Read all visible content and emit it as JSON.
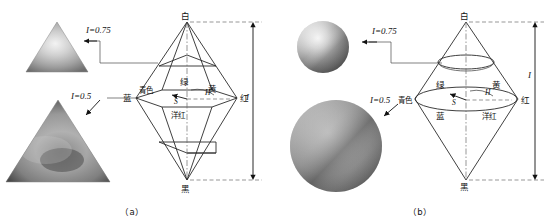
{
  "figure": {
    "panels": [
      {
        "id": "a",
        "caption": "（a）",
        "solid_shape": "double-triangular-cone",
        "cross_section_shape": "triangle",
        "vertex_labels": {
          "top": "白",
          "bottom": "黑",
          "left": "蓝",
          "right": "红"
        },
        "hue_labels": {
          "green": "绿",
          "cyan": "青色",
          "yellow": "黄",
          "blue": "蓝",
          "red": "红",
          "magenta": "洋红"
        },
        "annotations": {
          "hue_symbol": "H",
          "saturation_symbol": "S",
          "intensity_symbol": "I",
          "dimension_label": "I"
        },
        "callouts": [
          {
            "label": "I=0.75",
            "target": "upper cross-section triangle"
          },
          {
            "label": "I=0.5",
            "target": "mid cross-section triangle"
          }
        ],
        "swatches": [
          {
            "name": "intensity-0.75-triangle",
            "intensity": 0.75
          },
          {
            "name": "intensity-0.5-triangle",
            "intensity": 0.5
          }
        ]
      },
      {
        "id": "b",
        "caption": "（b）",
        "solid_shape": "double-circular-cone",
        "cross_section_shape": "circle",
        "vertex_labels": {
          "top": "白",
          "bottom": "黑",
          "right": "红"
        },
        "hue_labels": {
          "green": "绿",
          "cyan": "青色",
          "yellow": "黄",
          "blue": "蓝",
          "red": "红",
          "magenta": "洋红"
        },
        "annotations": {
          "hue_symbol": "H",
          "saturation_symbol": "S",
          "intensity_symbol": "I",
          "dimension_label": "I"
        },
        "callouts": [
          {
            "label": "I=0.75",
            "target": "upper cross-section circle"
          },
          {
            "label": "I=0.5",
            "target": "mid cross-section circle"
          }
        ],
        "swatches": [
          {
            "name": "intensity-0.75-sphere",
            "intensity": 0.75
          },
          {
            "name": "intensity-0.5-sphere",
            "intensity": 0.5
          }
        ]
      }
    ],
    "colors": {
      "line": "#2a2a2a",
      "dashed_guide": "#6b6b6b",
      "text": "#111111",
      "background": "#ffffff"
    }
  }
}
